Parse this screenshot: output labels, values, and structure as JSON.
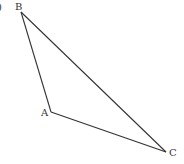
{
  "figure": {
    "part_label": ")",
    "vertices": [
      {
        "name": "B",
        "x": 21,
        "y": 12,
        "label_x": 15,
        "label_y": 10
      },
      {
        "name": "A",
        "x": 51,
        "y": 112,
        "label_x": 41,
        "label_y": 116
      },
      {
        "name": "C",
        "x": 166,
        "y": 152,
        "label_x": 169,
        "label_y": 156
      }
    ],
    "edges": [
      [
        "A",
        "B"
      ],
      [
        "B",
        "C"
      ],
      [
        "A",
        "C"
      ]
    ],
    "stroke_color": "#333333"
  }
}
